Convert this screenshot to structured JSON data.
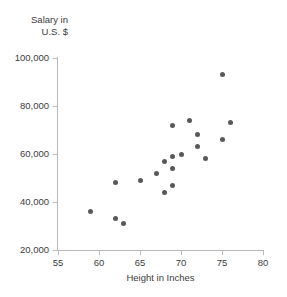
{
  "chart_data": {
    "type": "scatter",
    "title": "",
    "xlabel": "Height in Inches",
    "ylabel": "Salary in\nU.S. $",
    "ylabel_lines": [
      "Salary in",
      "U.S. $"
    ],
    "xlim": [
      55,
      80
    ],
    "ylim": [
      20000,
      100000
    ],
    "xticks": [
      55,
      60,
      65,
      70,
      75,
      80
    ],
    "yticks": [
      20000,
      40000,
      60000,
      80000,
      100000
    ],
    "xtick_labels": [
      "55",
      "60",
      "65",
      "70",
      "75",
      "80"
    ],
    "ytick_labels": [
      "20,000",
      "40,000",
      "60,000",
      "80,000",
      "100,000"
    ],
    "grid": false,
    "legend": null,
    "marker_color": "#595959",
    "axis_color": "#b9b9b9",
    "text_color": "#3c3c3c",
    "series": [
      {
        "name": "Height vs Salary",
        "points": [
          {
            "x": 59,
            "y": 36000
          },
          {
            "x": 62,
            "y": 48000
          },
          {
            "x": 62,
            "y": 33000
          },
          {
            "x": 63,
            "y": 31000
          },
          {
            "x": 65,
            "y": 49000
          },
          {
            "x": 67,
            "y": 52000
          },
          {
            "x": 68,
            "y": 57000
          },
          {
            "x": 68,
            "y": 44000
          },
          {
            "x": 69,
            "y": 72000
          },
          {
            "x": 69,
            "y": 59000
          },
          {
            "x": 69,
            "y": 54000
          },
          {
            "x": 69,
            "y": 47000
          },
          {
            "x": 70,
            "y": 60000
          },
          {
            "x": 71,
            "y": 74000
          },
          {
            "x": 72,
            "y": 68000
          },
          {
            "x": 72,
            "y": 63000
          },
          {
            "x": 73,
            "y": 58000
          },
          {
            "x": 75,
            "y": 93000
          },
          {
            "x": 75,
            "y": 66000
          },
          {
            "x": 76,
            "y": 73000
          }
        ]
      }
    ]
  }
}
